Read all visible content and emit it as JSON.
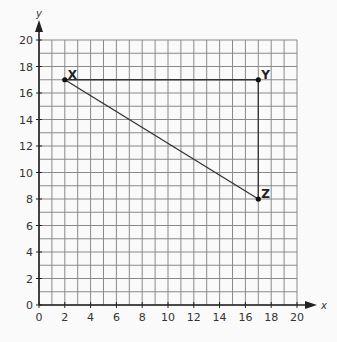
{
  "chart_data": {
    "type": "scatter",
    "title": "",
    "xlabel": "x",
    "ylabel": "y",
    "xlim": [
      0,
      20
    ],
    "ylim": [
      0,
      20
    ],
    "grid": true,
    "x_ticks": [
      0,
      2,
      4,
      6,
      8,
      10,
      12,
      14,
      16,
      18,
      20
    ],
    "y_ticks": [
      0,
      2,
      4,
      6,
      8,
      10,
      12,
      14,
      16,
      18,
      20
    ],
    "points": [
      {
        "label": "X",
        "x": 2,
        "y": 17
      },
      {
        "label": "Y",
        "x": 17,
        "y": 17
      },
      {
        "label": "Z",
        "x": 17,
        "y": 8
      }
    ],
    "segments": [
      [
        "X",
        "Y"
      ],
      [
        "Y",
        "Z"
      ],
      [
        "X",
        "Z"
      ]
    ]
  },
  "colors": {
    "grid": "#8a8a8a",
    "axis": "#222222",
    "line": "#333333",
    "background": "#fafafa"
  }
}
